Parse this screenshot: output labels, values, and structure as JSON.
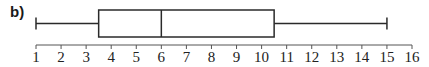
{
  "part_label": "b)",
  "chart_data": {
    "type": "boxplot",
    "title": "",
    "xlabel": "",
    "ylabel": "",
    "xlim": [
      1,
      16
    ],
    "ticks": [
      1,
      2,
      3,
      4,
      5,
      6,
      7,
      8,
      9,
      10,
      11,
      12,
      13,
      14,
      15,
      16
    ],
    "tick_labels": [
      "1",
      "2",
      "3",
      "4",
      "5",
      "6",
      "7",
      "8",
      "9",
      "10",
      "11",
      "12",
      "13",
      "14",
      "15",
      "16"
    ],
    "min": 1,
    "q1": 3.5,
    "median": 6,
    "q3": 10.5,
    "max": 15,
    "grid": false,
    "legend": null
  },
  "colors": {
    "stroke": "#2a2a2a",
    "text": "#222222"
  }
}
